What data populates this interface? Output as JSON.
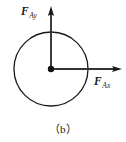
{
  "figure": {
    "caption": "（b）",
    "background_color": "#ffffff",
    "stroke_color": "#1a1a1a",
    "labels": {
      "vertical_force": {
        "symbol": "F",
        "subscript": "Ay"
      },
      "horizontal_force": {
        "symbol": "F",
        "subscript": "Ax"
      }
    },
    "geometry": {
      "circle": {
        "cx": 51,
        "cy": 69,
        "r": 37
      },
      "center_dot_radius": 3.2,
      "vertical_vector": {
        "x": 51,
        "y_start": 69,
        "y_tip": 7
      },
      "horizontal_vector": {
        "y": 69,
        "x_start": 51,
        "x_tip": 121
      }
    }
  }
}
